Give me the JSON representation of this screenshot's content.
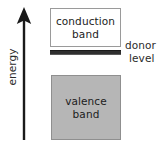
{
  "diagram": {
    "width": 163,
    "height": 153,
    "background_color": "#ffffff"
  },
  "axis": {
    "label": "energy",
    "icon": "up-arrow-icon",
    "orientation": "vertical",
    "direction": "up",
    "color": "#1a1a1a"
  },
  "bands": {
    "conduction": {
      "line1": "conduction",
      "line2": "band",
      "fill_color": "#ffffff",
      "border_color": "#9a9a9a"
    },
    "valence": {
      "line1": "valence",
      "line2": "band",
      "fill_color": "#b6b6b6",
      "border_color": "#8f8f8f"
    }
  },
  "donor_level": {
    "line1": "donor",
    "line2": "level",
    "bar_color": "#2f2f2f"
  }
}
